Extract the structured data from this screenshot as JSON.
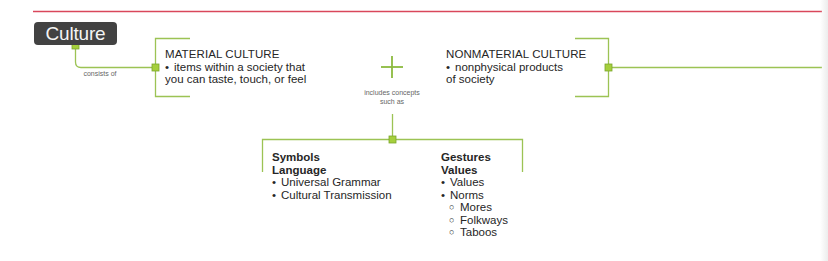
{
  "root": {
    "label": "Culture"
  },
  "edges": {
    "root_to_types": "consists of",
    "types_to_examples": [
      "includes concepts",
      "such as"
    ]
  },
  "combine_symbol": "+",
  "types": [
    {
      "title": "MATERIAL CULTURE",
      "bullet": "•",
      "description_lines": [
        "items within a society that",
        "you can taste, touch, or feel"
      ]
    },
    {
      "title": "NONMATERIAL CULTURE",
      "bullet": "•",
      "description_lines": [
        "nonphysical products",
        "of society"
      ]
    }
  ],
  "examples": [
    {
      "headings": [
        "Symbols",
        "Language"
      ],
      "items": [
        {
          "bullet": "•",
          "label": "Universal Grammar",
          "children": []
        },
        {
          "bullet": "•",
          "label": "Cultural Transmission",
          "children": []
        }
      ]
    },
    {
      "headings": [
        "Gestures",
        "Values"
      ],
      "items": [
        {
          "bullet": "•",
          "label": "Values",
          "children": []
        },
        {
          "bullet": "•",
          "label": "Norms",
          "children": [
            {
              "bullet": "○",
              "label": "Mores"
            },
            {
              "bullet": "○",
              "label": "Folkways"
            },
            {
              "bullet": "○",
              "label": "Taboos"
            }
          ]
        }
      ]
    }
  ],
  "colors": {
    "connector": "#9cc354",
    "node": "#a5cf3c",
    "node_border": "#7aa62b",
    "header_rule": "#d9475b",
    "root_bg": "#424242"
  }
}
